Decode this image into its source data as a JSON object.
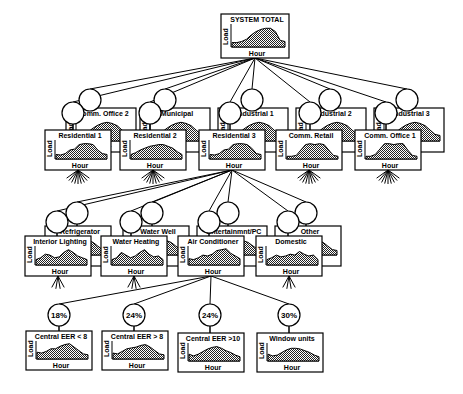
{
  "diagram": {
    "type": "load-disaggregation-tree",
    "axis_labels": {
      "y": "Load",
      "x": "Hour"
    },
    "root": {
      "id": "system-total",
      "title": "SYSTEM TOTAL",
      "x": 221,
      "y": 14,
      "w": 68,
      "h": 44
    },
    "level1": [
      {
        "id": "comm-office-2",
        "title": "Comm. Office 2",
        "x": 66,
        "y": 108,
        "w": 70,
        "h": 44,
        "back": true,
        "bubble": [
          90,
          100
        ]
      },
      {
        "id": "municipal",
        "title": "Municipal",
        "x": 140,
        "y": 108,
        "w": 70,
        "h": 44,
        "back": true,
        "bubble": [
          165,
          100
        ]
      },
      {
        "id": "industrial-1",
        "title": "Industrial 1",
        "x": 218,
        "y": 108,
        "w": 70,
        "h": 44,
        "back": true,
        "bubble": [
          252,
          100
        ]
      },
      {
        "id": "industrial-2",
        "title": "Industrial 2",
        "x": 296,
        "y": 108,
        "w": 70,
        "h": 44,
        "back": true,
        "bubble": [
          330,
          100
        ]
      },
      {
        "id": "industrial-3",
        "title": "Industrial 3",
        "x": 374,
        "y": 108,
        "w": 70,
        "h": 44,
        "back": true,
        "bubble": [
          407,
          100
        ]
      },
      {
        "id": "residential-1",
        "title": "Residential 1",
        "x": 45,
        "y": 130,
        "w": 66,
        "h": 40,
        "back": false,
        "bubble": [
          73,
          113
        ]
      },
      {
        "id": "residential-2",
        "title": "Residential 2",
        "x": 120,
        "y": 130,
        "w": 66,
        "h": 40,
        "back": false,
        "bubble": [
          150,
          113
        ]
      },
      {
        "id": "residential-3",
        "title": "Residential 3",
        "x": 199,
        "y": 130,
        "w": 66,
        "h": 40,
        "back": false,
        "bubble": [
          230,
          113
        ]
      },
      {
        "id": "comm-retail",
        "title": "Comm.  Retail",
        "x": 276,
        "y": 130,
        "w": 66,
        "h": 40,
        "back": false,
        "bubble": [
          310,
          113
        ]
      },
      {
        "id": "comm-office-1",
        "title": "Comm. Office 1",
        "x": 355,
        "y": 130,
        "w": 66,
        "h": 40,
        "back": false,
        "bubble": [
          386,
          113
        ]
      }
    ],
    "level2": [
      {
        "id": "refrigerator",
        "title": "Refrigerator",
        "x": 45,
        "y": 226,
        "w": 66,
        "h": 40,
        "back": true,
        "bubble": [
          77,
          213
        ]
      },
      {
        "id": "water-well",
        "title": "Water Well",
        "x": 123,
        "y": 226,
        "w": 66,
        "h": 40,
        "back": true,
        "bubble": [
          152,
          213
        ]
      },
      {
        "id": "entertainment-pc",
        "title": "Entertainmnt/PC",
        "x": 197,
        "y": 226,
        "w": 70,
        "h": 40,
        "back": true,
        "bubble": [
          228,
          213
        ]
      },
      {
        "id": "other",
        "title": "Other",
        "x": 275,
        "y": 226,
        "w": 66,
        "h": 40,
        "back": true,
        "bubble": [
          306,
          213
        ]
      },
      {
        "id": "interior-lighting",
        "title": "Interior Lighting",
        "x": 25,
        "y": 236,
        "w": 66,
        "h": 40,
        "back": false,
        "bubble": [
          57,
          222
        ]
      },
      {
        "id": "water-heating",
        "title": "Water Heating",
        "x": 101,
        "y": 236,
        "w": 66,
        "h": 40,
        "back": false,
        "bubble": [
          131,
          222
        ]
      },
      {
        "id": "air-conditioner",
        "title": "Air Conditioner",
        "x": 178,
        "y": 236,
        "w": 66,
        "h": 40,
        "back": false,
        "bubble": [
          209,
          222
        ]
      },
      {
        "id": "domestic",
        "title": "Domestic",
        "x": 256,
        "y": 236,
        "w": 66,
        "h": 40,
        "back": false,
        "bubble": [
          288,
          222
        ]
      }
    ],
    "level3": [
      {
        "id": "central-eer-lt-8",
        "title": "Central EER < 8",
        "pct": "18%",
        "x": 26,
        "y": 331,
        "w": 66,
        "h": 39,
        "bubble": [
          59,
          315
        ]
      },
      {
        "id": "central-eer-gt-8",
        "title": "Central EER > 8",
        "pct": "24%",
        "x": 102,
        "y": 331,
        "w": 66,
        "h": 39,
        "bubble": [
          134,
          315
        ]
      },
      {
        "id": "central-eer-gt-10",
        "title": "Central EER >10",
        "pct": "24%",
        "x": 178,
        "y": 333,
        "w": 66,
        "h": 39,
        "bubble": [
          210,
          315
        ]
      },
      {
        "id": "window-units",
        "title": "Window units",
        "pct": "30%",
        "x": 257,
        "y": 333,
        "w": 66,
        "h": 39,
        "bubble": [
          289,
          315
        ]
      }
    ]
  }
}
